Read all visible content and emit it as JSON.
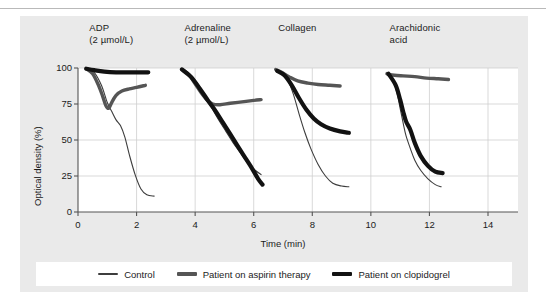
{
  "figure": {
    "background_color": "#eaeaea",
    "plot_background_color": "#ffffff",
    "grid_color": "#cfcfcf",
    "axis_color": "#555555"
  },
  "legend": {
    "items": [
      {
        "label": "Control",
        "color": "#3d3d3d",
        "thickness": 2.0
      },
      {
        "label": "Patient on aspirin therapy",
        "color": "#555555",
        "thickness": 3.2
      },
      {
        "label": "Patient on clopidogrel",
        "color": "#121212",
        "thickness": 4.0
      }
    ]
  },
  "chart_data": {
    "type": "line",
    "title": "",
    "xlabel": "Time (min)",
    "ylabel": "Optical density (%)",
    "xlim": [
      0,
      14
    ],
    "ylim": [
      0,
      100
    ],
    "xticks": [
      0,
      2,
      4,
      6,
      8,
      10,
      12,
      14
    ],
    "yticks": [
      0,
      25,
      50,
      75,
      100
    ],
    "grid": true,
    "legend_position": "bottom",
    "panels": [
      {
        "title": "ADP\n(2 µmol/L)",
        "title_lines": [
          "ADP",
          "(2 µmol/L)"
        ],
        "x_start": 0.25,
        "series": [
          {
            "name": "Control",
            "color": "#3d3d3d",
            "thickness": 1.1,
            "points": [
              [
                0.28,
                99.5
              ],
              [
                0.55,
                97
              ],
              [
                0.8,
                88
              ],
              [
                1.0,
                76
              ],
              [
                1.15,
                70
              ],
              [
                1.3,
                64
              ],
              [
                1.45,
                60
              ],
              [
                1.6,
                52
              ],
              [
                1.75,
                40
              ],
              [
                1.95,
                26
              ],
              [
                2.15,
                16
              ],
              [
                2.35,
                12
              ],
              [
                2.6,
                11
              ]
            ]
          },
          {
            "name": "Patient on aspirin therapy",
            "color": "#555555",
            "thickness": 3.4,
            "points": [
              [
                0.28,
                99.5
              ],
              [
                0.5,
                96
              ],
              [
                0.7,
                88
              ],
              [
                0.85,
                80
              ],
              [
                0.95,
                74
              ],
              [
                1.05,
                72
              ],
              [
                1.15,
                76
              ],
              [
                1.3,
                81
              ],
              [
                1.5,
                84
              ],
              [
                1.75,
                85.5
              ],
              [
                2.0,
                86.5
              ],
              [
                2.3,
                88
              ]
            ]
          },
          {
            "name": "Patient on clopidogrel",
            "color": "#121212",
            "thickness": 4.2,
            "points": [
              [
                0.28,
                99.5
              ],
              [
                0.55,
                98.5
              ],
              [
                0.9,
                97.5
              ],
              [
                1.3,
                97
              ],
              [
                1.7,
                97
              ],
              [
                2.1,
                97
              ],
              [
                2.4,
                97
              ]
            ]
          }
        ]
      },
      {
        "title": "Adrenaline\n(2 µmol/L)",
        "title_lines": [
          "Adrenaline",
          "(2 µmol/L)"
        ],
        "x_start": 3.5,
        "series": [
          {
            "name": "Control",
            "color": "#3d3d3d",
            "thickness": 1.1,
            "points": [
              [
                3.55,
                99
              ],
              [
                3.8,
                96
              ],
              [
                4.05,
                90
              ],
              [
                4.3,
                82
              ],
              [
                4.55,
                73
              ],
              [
                4.8,
                64
              ],
              [
                5.05,
                56
              ],
              [
                5.3,
                48
              ],
              [
                5.55,
                41
              ],
              [
                5.8,
                34
              ],
              [
                6.05,
                29
              ],
              [
                6.25,
                26
              ]
            ]
          },
          {
            "name": "Patient on aspirin therapy",
            "color": "#555555",
            "thickness": 3.4,
            "points": [
              [
                3.55,
                99
              ],
              [
                3.8,
                95
              ],
              [
                4.0,
                89
              ],
              [
                4.2,
                83
              ],
              [
                4.4,
                78
              ],
              [
                4.6,
                75
              ],
              [
                4.85,
                74.5
              ],
              [
                5.2,
                75.5
              ],
              [
                5.6,
                76.5
              ],
              [
                6.0,
                77.5
              ],
              [
                6.25,
                78
              ]
            ]
          },
          {
            "name": "Patient on clopidogrel",
            "color": "#121212",
            "thickness": 4.2,
            "points": [
              [
                3.55,
                99
              ],
              [
                3.85,
                94
              ],
              [
                4.15,
                86
              ],
              [
                4.45,
                77
              ],
              [
                4.7,
                70
              ],
              [
                4.95,
                62
              ],
              [
                5.2,
                54
              ],
              [
                5.45,
                46
              ],
              [
                5.7,
                38
              ],
              [
                5.95,
                30
              ],
              [
                6.15,
                23
              ],
              [
                6.3,
                19
              ]
            ]
          }
        ]
      },
      {
        "title": "Collagen",
        "title_lines": [
          "Collagen"
        ],
        "x_start": 6.7,
        "series": [
          {
            "name": "Control",
            "color": "#3d3d3d",
            "thickness": 1.1,
            "points": [
              [
                6.75,
                99
              ],
              [
                6.95,
                97
              ],
              [
                7.15,
                92
              ],
              [
                7.35,
                82
              ],
              [
                7.55,
                68
              ],
              [
                7.75,
                55
              ],
              [
                7.95,
                44
              ],
              [
                8.2,
                33
              ],
              [
                8.45,
                25
              ],
              [
                8.7,
                20
              ],
              [
                9.0,
                18
              ],
              [
                9.25,
                17.5
              ]
            ]
          },
          {
            "name": "Patient on aspirin therapy",
            "color": "#555555",
            "thickness": 3.4,
            "points": [
              [
                6.75,
                99
              ],
              [
                6.95,
                97
              ],
              [
                7.2,
                94
              ],
              [
                7.5,
                91
              ],
              [
                7.85,
                89.5
              ],
              [
                8.2,
                88.5
              ],
              [
                8.6,
                88
              ],
              [
                8.95,
                87.5
              ]
            ]
          },
          {
            "name": "Patient on clopidogrel",
            "color": "#121212",
            "thickness": 4.2,
            "points": [
              [
                6.8,
                98
              ],
              [
                7.05,
                95
              ],
              [
                7.3,
                88
              ],
              [
                7.55,
                79
              ],
              [
                7.8,
                71
              ],
              [
                8.05,
                65
              ],
              [
                8.3,
                61
              ],
              [
                8.6,
                58
              ],
              [
                8.95,
                56
              ],
              [
                9.25,
                55
              ]
            ]
          }
        ]
      },
      {
        "title": "Arachidonic\nacid",
        "title_lines": [
          "Arachidonic",
          "acid"
        ],
        "x_start": 10.5,
        "series": [
          {
            "name": "Control",
            "color": "#3d3d3d",
            "thickness": 1.1,
            "points": [
              [
                10.55,
                97
              ],
              [
                10.75,
                92
              ],
              [
                10.9,
                82
              ],
              [
                11.0,
                72
              ],
              [
                11.1,
                62
              ],
              [
                11.2,
                53
              ],
              [
                11.35,
                44
              ],
              [
                11.5,
                36
              ],
              [
                11.7,
                29
              ],
              [
                11.95,
                23
              ],
              [
                12.2,
                19
              ],
              [
                12.4,
                17.5
              ]
            ]
          },
          {
            "name": "Patient on aspirin therapy",
            "color": "#555555",
            "thickness": 3.4,
            "points": [
              [
                10.55,
                96
              ],
              [
                10.8,
                95
              ],
              [
                11.1,
                94.5
              ],
              [
                11.5,
                94
              ],
              [
                11.9,
                93
              ],
              [
                12.3,
                92.5
              ],
              [
                12.65,
                92
              ]
            ]
          },
          {
            "name": "Patient on clopidogrel",
            "color": "#121212",
            "thickness": 4.2,
            "points": [
              [
                10.6,
                96
              ],
              [
                10.85,
                88
              ],
              [
                11.0,
                78
              ],
              [
                11.1,
                70
              ],
              [
                11.2,
                63
              ],
              [
                11.35,
                57
              ],
              [
                11.5,
                48
              ],
              [
                11.7,
                39
              ],
              [
                11.95,
                32
              ],
              [
                12.2,
                28
              ],
              [
                12.45,
                27
              ]
            ]
          }
        ]
      }
    ]
  }
}
